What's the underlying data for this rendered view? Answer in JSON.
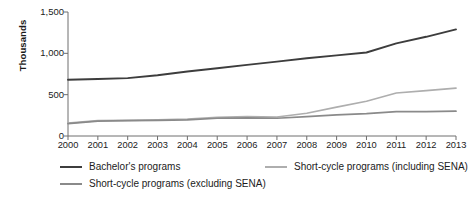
{
  "chart_data": {
    "type": "line",
    "title": "",
    "xlabel": "",
    "ylabel": "Thousands",
    "x": [
      2000,
      2001,
      2002,
      2003,
      2004,
      2005,
      2006,
      2007,
      2008,
      2009,
      2010,
      2011,
      2012,
      2013
    ],
    "xtick_labels": [
      "2000",
      "2001",
      "2002",
      "2003",
      "2004",
      "2005",
      "2006",
      "2007",
      "2008",
      "2009",
      "2010",
      "2011",
      "2012",
      "2013"
    ],
    "ytick_labels": [
      "0",
      "500",
      "1,000",
      "1,500"
    ],
    "ytick_values": [
      0,
      500,
      1000,
      1500
    ],
    "ylim": [
      0,
      1500
    ],
    "xlim": [
      2000,
      2013
    ],
    "grid": false,
    "legend_position": "below",
    "series": [
      {
        "name": "Bachelor's programs",
        "color": "#3d3d3d",
        "values": [
          680,
          690,
          700,
          735,
          780,
          820,
          860,
          900,
          940,
          975,
          1010,
          1120,
          1200,
          1290
        ]
      },
      {
        "name": "Short-cycle programs (including SENA)",
        "color": "#aeaeae",
        "values": [
          155,
          185,
          190,
          195,
          205,
          225,
          235,
          230,
          275,
          350,
          420,
          520,
          550,
          580
        ]
      },
      {
        "name": "Short-cycle programs (excluding SENA)",
        "color": "#8a8a8a",
        "values": [
          150,
          180,
          185,
          188,
          195,
          215,
          220,
          215,
          235,
          255,
          270,
          295,
          295,
          300
        ]
      }
    ]
  }
}
